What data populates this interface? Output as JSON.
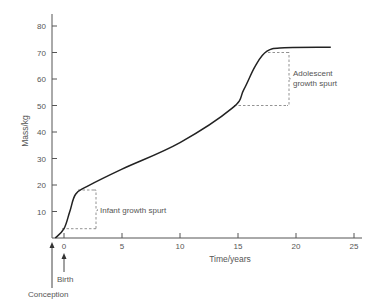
{
  "chart_data": {
    "type": "line",
    "title": "",
    "xlabel": "Time/years",
    "ylabel": "Mass/kg",
    "xlim": [
      -0.75,
      25
    ],
    "ylim": [
      0,
      85
    ],
    "x_ticks": [
      0,
      5,
      10,
      15,
      20,
      25
    ],
    "y_ticks": [
      10,
      20,
      30,
      40,
      50,
      60,
      70,
      80
    ],
    "grid": false,
    "series": [
      {
        "name": "Human body mass",
        "x": [
          -0.75,
          0,
          0.5,
          1,
          2,
          5,
          10,
          14.5,
          15.5,
          16.5,
          17.5,
          19,
          23
        ],
        "values": [
          0,
          3.5,
          10,
          16.5,
          19.5,
          26,
          36,
          49,
          56,
          65,
          70.5,
          71.8,
          72
        ]
      }
    ],
    "annotations": [
      {
        "text": "Infant growth spurt",
        "bracket_x": 2.8,
        "from_mass": 3.5,
        "to_mass": 17.5
      },
      {
        "text": "Adolescent growth spurt",
        "bracket_x": 19.3,
        "from_mass": 50,
        "to_mass": 70
      },
      {
        "text": "Birth",
        "x": 0
      },
      {
        "text": "Conception",
        "x": -0.75
      }
    ]
  },
  "labels": {
    "ylabel": "Mass/kg",
    "xlabel": "Time/years",
    "infant_line1": "Infant growth spurt",
    "adolescent_line1": "Adolescent",
    "adolescent_line2": "growth spurt",
    "birth": "Birth",
    "conception": "Conception"
  }
}
